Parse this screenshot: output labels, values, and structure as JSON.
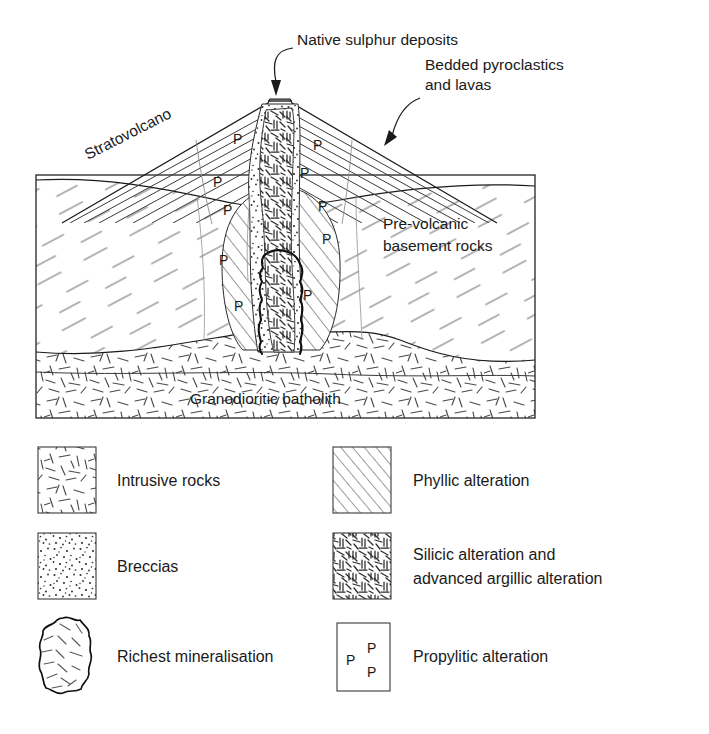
{
  "figure": {
    "type": "geological-cross-section",
    "title_visible": false,
    "background_color": "#ffffff",
    "line_color": "#1a1a1a"
  },
  "annotations": [
    {
      "id": "native-sulphur",
      "text": "Native sulphur deposits",
      "x": 297,
      "y": 45,
      "anchor": "start",
      "leader": "curved-arrow-down-left",
      "arrow_target": {
        "x": 279,
        "y": 98
      }
    },
    {
      "id": "bedded-pyroclastics",
      "text_line1": "Bedded pyroclastics",
      "text_line2": "and lavas",
      "x": 425,
      "y": 92,
      "anchor": "start",
      "leader": "curved-arrow-down-left",
      "arrow_target": {
        "x": 386,
        "y": 143
      }
    },
    {
      "id": "stratovolcano",
      "text": "Stratovolcano",
      "x": 88,
      "y": 160,
      "rotation_deg": -27,
      "anchor": "start"
    },
    {
      "id": "pre-volcanic-basement",
      "text_line1": "Pre-volcanic",
      "text_line2": "basement rocks",
      "x": 383,
      "y": 246,
      "anchor": "start"
    },
    {
      "id": "granodioritic-batholith",
      "text": "Granodioritic batholith",
      "x": 190,
      "y": 404,
      "anchor": "start"
    }
  ],
  "propylitic_marks": {
    "symbol": "P",
    "positions": [
      {
        "x": 233,
        "y": 144
      },
      {
        "x": 313,
        "y": 150
      },
      {
        "x": 213,
        "y": 187
      },
      {
        "x": 300,
        "y": 178
      },
      {
        "x": 223,
        "y": 215
      },
      {
        "x": 318,
        "y": 211
      },
      {
        "x": 322,
        "y": 244
      },
      {
        "x": 219,
        "y": 265
      },
      {
        "x": 303,
        "y": 300
      },
      {
        "x": 234,
        "y": 311
      }
    ]
  },
  "legend": {
    "columns": 2,
    "items": [
      {
        "id": "intrusive-rocks",
        "label": "Intrusive rocks",
        "swatch": "random-dash-texture",
        "swatch_x": 38,
        "swatch_y": 447,
        "swatch_w": 58,
        "swatch_h": 66,
        "label_x": 117,
        "label_y": 486
      },
      {
        "id": "breccias",
        "label": "Breccias",
        "swatch": "stipple-dots",
        "swatch_x": 38,
        "swatch_y": 533,
        "swatch_w": 58,
        "swatch_h": 66,
        "label_x": 117,
        "label_y": 572
      },
      {
        "id": "richest-mineralisation",
        "label": "Richest mineralisation",
        "swatch": "irregular-blob-hatched",
        "swatch_x": 38,
        "swatch_y": 617,
        "swatch_w": 52,
        "swatch_h": 76,
        "label_x": 117,
        "label_y": 662
      },
      {
        "id": "phyllic-alteration",
        "label": "Phyllic alteration",
        "swatch": "diagonal-hatch",
        "swatch_x": 333,
        "swatch_y": 447,
        "swatch_w": 58,
        "swatch_h": 66,
        "label_x": 413,
        "label_y": 486
      },
      {
        "id": "silicic-advanced-argillic",
        "label_line1": "Silicic alteration and",
        "label_line2": "advanced argillic alteration",
        "swatch": "dense-interlocking-texture",
        "swatch_x": 333,
        "swatch_y": 533,
        "swatch_w": 58,
        "swatch_h": 66,
        "label_x": 413,
        "label_y": 560
      },
      {
        "id": "propylitic-alteration",
        "label": "Propylitic alteration",
        "swatch": "p-symbols-box",
        "swatch_letters": [
          "P",
          "P",
          "P"
        ],
        "swatch_x": 337,
        "swatch_y": 623,
        "swatch_w": 53,
        "swatch_h": 68,
        "label_x": 413,
        "label_y": 662
      }
    ]
  },
  "cross_section": {
    "frame": {
      "x": 36,
      "y": 175,
      "w": 499,
      "h": 243
    },
    "units": [
      {
        "id": "pre-volcanic-basement-rocks",
        "pattern": "sparse-diagonal-dashes"
      },
      {
        "id": "granodioritic-batholith",
        "pattern": "random-dash-texture"
      },
      {
        "id": "stratovolcano-cone",
        "pattern": "bedded-parallel-layers"
      },
      {
        "id": "breccia-pipe",
        "pattern": "stipple-dots"
      },
      {
        "id": "silicic-core",
        "pattern": "dense-interlocking-texture"
      },
      {
        "id": "phyllic-halo",
        "pattern": "diagonal-hatch"
      },
      {
        "id": "richest-mineralisation-zone",
        "pattern": "heavy-irregular-outline"
      },
      {
        "id": "propylitic-halo",
        "pattern": "p-symbols"
      }
    ],
    "summit_crater": {
      "x": 268,
      "y": 103,
      "w": 24,
      "lines": 3
    }
  }
}
